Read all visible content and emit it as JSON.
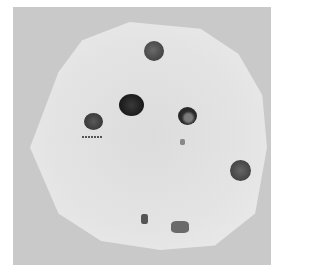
{
  "image": {
    "description": "Grayscale photograph of an agar plate (petri dish) with dark circular spots",
    "colors": {
      "background": "#c9c9c9",
      "dish": "#e2e2e2",
      "spot_dark": "#2a2a2a",
      "spot_medium": "#4a4a4a"
    },
    "spots": [
      {
        "name": "top",
        "cx": 154,
        "cy": 51,
        "r": 10,
        "color": "#505050"
      },
      {
        "name": "center",
        "cx": 131,
        "cy": 105,
        "r": 12,
        "color": "#1e1e1e"
      },
      {
        "name": "right-center",
        "cx": 187,
        "cy": 116,
        "r": 9,
        "color": "#333333"
      },
      {
        "name": "left",
        "cx": 93,
        "cy": 121,
        "r": 9,
        "color": "#404040"
      },
      {
        "name": "far-right",
        "cx": 241,
        "cy": 171,
        "r": 10,
        "color": "#4a4a4a"
      }
    ]
  }
}
